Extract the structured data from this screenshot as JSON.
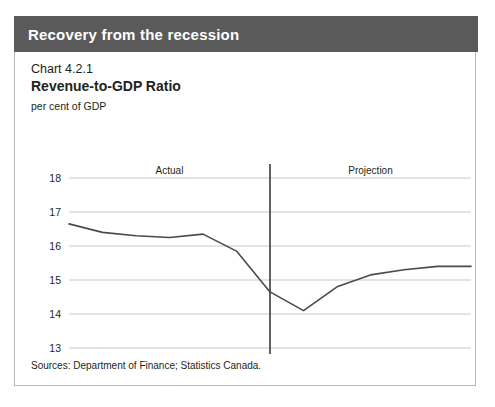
{
  "header": {
    "title": "Recovery from the recession"
  },
  "chart": {
    "number": "Chart 4.2.1",
    "title": "Revenue-to-GDP Ratio",
    "units": "per cent of GDP",
    "source": "Sources: Department of Finance; Statistics Canada."
  },
  "chart_data": {
    "type": "line",
    "title": "Revenue-to-GDP Ratio",
    "subtitle": "Chart 4.2.1",
    "xlabel": "",
    "ylabel": "per cent of GDP",
    "ylim": [
      12,
      18
    ],
    "yticks": [
      12,
      13,
      14,
      15,
      16,
      17,
      18
    ],
    "grid": true,
    "legend": "none",
    "categories": [
      "2002–\n2003",
      "2003–\n2004",
      "2004–\n2005",
      "2005–\n2006",
      "2006–\n2007",
      "2007–\n2008",
      "2008–\n2009",
      "2009–\n2010",
      "2010–\n2011",
      "2011–\n2012",
      "2012–\n2013",
      "2013–\n2014",
      "2014–\n2015"
    ],
    "categories_top": [
      "2002–",
      "2003–",
      "2004–",
      "2005–",
      "2006–",
      "2007–",
      "2008–",
      "2009–",
      "2010–",
      "2011–",
      "2012–",
      "2013–",
      "2014–"
    ],
    "categories_bottom": [
      "2003",
      "2004",
      "2005",
      "2006",
      "2007",
      "2008",
      "2009",
      "2010",
      "2011",
      "2012",
      "2013",
      "2014",
      "2015"
    ],
    "values": [
      16.65,
      16.4,
      16.3,
      16.25,
      16.35,
      15.85,
      14.65,
      14.1,
      14.8,
      15.15,
      15.3,
      15.4,
      15.4
    ],
    "annotations": [
      {
        "text": "Actual",
        "at_category_index": 3
      },
      {
        "text": "Projection",
        "at_category_index": 9
      }
    ],
    "divider_after_category_index": 6,
    "series_color": "#4a4a4a"
  }
}
